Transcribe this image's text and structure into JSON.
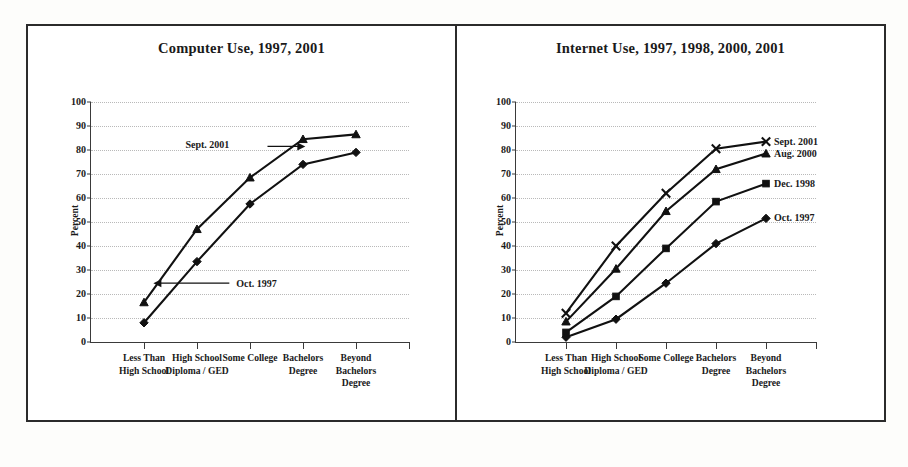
{
  "chart_data": [
    {
      "type": "line",
      "title": "Computer Use, 1997, 2001",
      "xlabel": "",
      "ylabel": "Percent",
      "ylim": [
        0,
        100
      ],
      "ytick_step": 10,
      "yticks": [
        "0",
        "10",
        "20",
        "30",
        "40",
        "50",
        "60",
        "70",
        "80",
        "90",
        "100"
      ],
      "grid": true,
      "legend_position": "inline-annotation",
      "categories": [
        "Less Than\nHigh School",
        "High School\nDiploma / GED",
        "Some College",
        "Bachelors\nDegree",
        "Beyond\nBachelors\nDegree"
      ],
      "series": [
        {
          "name": "Sept. 2001",
          "marker": "triangle",
          "values": [
            16.5,
            47,
            68.5,
            84.5,
            86.5
          ]
        },
        {
          "name": "Oct. 1997",
          "marker": "diamond",
          "values": [
            8,
            33.5,
            57.5,
            74,
            79
          ]
        }
      ],
      "annotations": [
        {
          "text": "Sept. 2001",
          "arrow": "right"
        },
        {
          "text": "Oct. 1997",
          "arrow": "left"
        }
      ]
    },
    {
      "type": "line",
      "title": "Internet Use, 1997, 1998, 2000, 2001",
      "xlabel": "",
      "ylabel": "Percent",
      "ylim": [
        0,
        100
      ],
      "ytick_step": 10,
      "yticks": [
        "0",
        "10",
        "20",
        "30",
        "40",
        "50",
        "60",
        "70",
        "80",
        "90",
        "100"
      ],
      "grid": true,
      "legend_position": "right-inline",
      "categories": [
        "Less Than\nHigh School",
        "High School\nDiploma / GED",
        "Some College",
        "Bachelors\nDegree",
        "Beyond\nBachelors\nDegree"
      ],
      "series": [
        {
          "name": "Sept. 2001",
          "marker": "x",
          "values": [
            12,
            40,
            62,
            80.5,
            83.5
          ]
        },
        {
          "name": "Aug. 2000",
          "marker": "triangle",
          "values": [
            8.5,
            30.5,
            54.5,
            72,
            78.5
          ]
        },
        {
          "name": "Dec. 1998",
          "marker": "square",
          "values": [
            4,
            19,
            39,
            58.5,
            66
          ]
        },
        {
          "name": "Oct. 1997",
          "marker": "diamond",
          "values": [
            2,
            9.5,
            24.5,
            41,
            51.5
          ]
        }
      ],
      "annotations": []
    }
  ],
  "panels": [
    {
      "title": "Computer Use, 1997, 2001"
    },
    {
      "title": "Internet Use, 1997, 1998, 2000, 2001"
    }
  ]
}
